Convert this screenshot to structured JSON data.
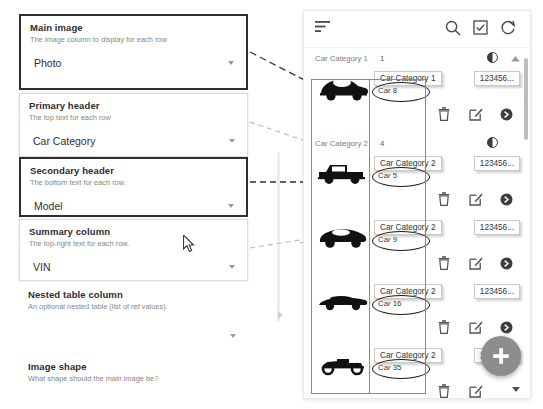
{
  "config_panel": {
    "fields": [
      {
        "title": "Main image",
        "description": "The image column to display for each row",
        "value": "Photo",
        "highlight": "strong"
      },
      {
        "title": "Primary header",
        "description": "The top text for each row",
        "value": "Car Category",
        "highlight": "soft"
      },
      {
        "title": "Secondary header",
        "description": "The bottom text for each row.",
        "value": "Model",
        "highlight": "strong"
      },
      {
        "title": "Summary column",
        "description": "The top-right text for each row.",
        "value": "VIN",
        "highlight": "soft"
      },
      {
        "title": "Nested table column",
        "description": "An optional nested table (list of ref values).",
        "value": "",
        "highlight": "none"
      },
      {
        "title": "Image shape",
        "description": "What shape should the main image be?",
        "value": "",
        "highlight": "none"
      }
    ]
  },
  "preview": {
    "toolbar": {
      "sort_icon": "sort-icon",
      "search_icon": "search-icon",
      "select_icon": "checkbox-select-icon",
      "refresh_icon": "refresh-icon"
    },
    "groups": [
      {
        "name": "Car Category 1",
        "count": "1"
      },
      {
        "name": "Car Category 2",
        "count": "4"
      }
    ],
    "rows": [
      {
        "primary": "Car Category 1",
        "secondary": "Car 8",
        "summary": "123456...",
        "image": "car-beetle-icon",
        "group": 0
      },
      {
        "primary": "Car Category 2",
        "secondary": "Car 5",
        "summary": "123456...",
        "image": "car-pickup-icon",
        "group": 1
      },
      {
        "primary": "Car Category 2",
        "secondary": "Car 9",
        "summary": "123456...",
        "image": "car-sports-icon",
        "group": 1
      },
      {
        "primary": "Car Category 2",
        "secondary": "Car 16",
        "summary": "123456...",
        "image": "car-muscle-icon",
        "group": 1
      },
      {
        "primary": "Car Category 2",
        "secondary": "Car 35",
        "summary": "123456...",
        "image": "car-roadster-icon",
        "group": 1
      }
    ],
    "row_actions": {
      "delete_icon": "trash-icon",
      "edit_icon": "edit-icon",
      "open_icon": "arrow-right-circle-icon"
    },
    "fab": {
      "icon": "plus-icon"
    }
  },
  "colors": {
    "highlight_border": "#2e2e2e",
    "soft_border": "#dcdcdc",
    "text_primary": "#2d2d2d",
    "text_muted": "#868686",
    "fab_bg": "#8d8d8d",
    "connector": "#9a9a9a"
  }
}
